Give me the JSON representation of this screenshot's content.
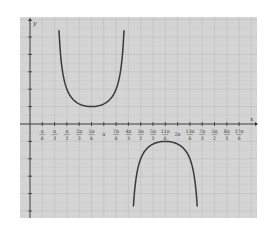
{
  "chart_data": {
    "type": "line",
    "title": "",
    "function": "y = csc(x - π/3)",
    "xlabel": "x",
    "ylabel": "y",
    "x_tick_labels": [
      {
        "num": "π",
        "den": "6"
      },
      {
        "num": "π",
        "den": "3"
      },
      {
        "num": "π",
        "den": "2"
      },
      {
        "num": "2π",
        "den": "3"
      },
      {
        "num": "5π",
        "den": "6"
      },
      {
        "num": "π",
        "den": ""
      },
      {
        "num": "7π",
        "den": "6"
      },
      {
        "num": "4π",
        "den": "3"
      },
      {
        "num": "3π",
        "den": "2"
      },
      {
        "num": "5π",
        "den": "3"
      },
      {
        "num": "11π",
        "den": "6"
      },
      {
        "num": "2π",
        "den": ""
      },
      {
        "num": "13π",
        "den": "6"
      },
      {
        "num": "7π",
        "den": "3"
      },
      {
        "num": "5π",
        "den": "2"
      },
      {
        "num": "8π",
        "den": "3"
      },
      {
        "num": "17π",
        "den": "6"
      }
    ],
    "x_step": "π/6",
    "xlim_units_of_pi_over_6": [
      -0.8,
      18.5
    ],
    "ylim": [
      -6.2,
      5.6
    ],
    "y_tick_step": 1,
    "grid": true,
    "series": [
      {
        "name": "upper branch",
        "x_range": [
          "π/3",
          "4π/3"
        ],
        "vertex": {
          "x": "5π/6",
          "y": 1
        },
        "opens": "up"
      },
      {
        "name": "lower branch",
        "x_range": [
          "4π/3",
          "7π/3"
        ],
        "vertex": {
          "x": "11π/6",
          "y": -1
        },
        "opens": "down"
      }
    ],
    "asymptotes": [
      "π/3",
      "4π/3",
      "7π/3"
    ],
    "colors": {
      "background": "#d4d4d4",
      "grid": "#bcbcbc",
      "axis": "#333333",
      "curve": "#3a3a3a"
    }
  }
}
